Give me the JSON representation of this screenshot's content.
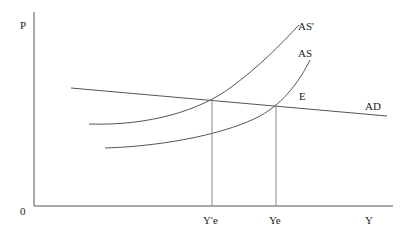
{
  "diagram": {
    "axes": {
      "y_label": "P",
      "x_label": "Y",
      "origin_label": "0"
    },
    "curves": {
      "as_prime": "AS'",
      "as": "AS",
      "ad": "AD"
    },
    "points": {
      "equilibrium": "E"
    },
    "x_ticks": {
      "y_e_prime": "Y'e",
      "y_e": "Ye"
    }
  }
}
